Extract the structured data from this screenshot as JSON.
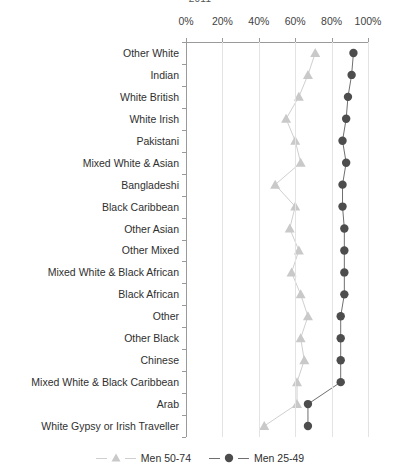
{
  "chart_data": {
    "type": "scatter",
    "title": "2011",
    "xlabel": "",
    "ylabel": "",
    "xlim": [
      0,
      100
    ],
    "xticks": [
      "0%",
      "20%",
      "40%",
      "60%",
      "80%",
      "100%"
    ],
    "xtick_values": [
      0,
      20,
      40,
      60,
      80,
      100
    ],
    "grid": "vertical",
    "axis_position": "top",
    "legend_position": "bottom-center",
    "categories": [
      "Other White",
      "Indian",
      "White British",
      "White Irish",
      "Pakistani",
      "Mixed White & Asian",
      "Bangladeshi",
      "Black Caribbean",
      "Other Asian",
      "Other Mixed",
      "Mixed White & Black African",
      "Black African",
      "Other",
      "Other Black",
      "Chinese",
      "Mixed White & Black Caribbean",
      "Arab",
      "White Gypsy or Irish Traveller"
    ],
    "series": [
      {
        "name": "Men 50-74",
        "marker": "triangle",
        "color": "#c9c9c9",
        "line_color": "#cfcfcf",
        "values": [
          71,
          67,
          62,
          55,
          60,
          63,
          49,
          60,
          57,
          62,
          58,
          63,
          67,
          63,
          65,
          61,
          61,
          43
        ]
      },
      {
        "name": "Men 25-49",
        "marker": "circle",
        "color": "#4d4d4d",
        "line_color": "#6f6f6f",
        "values": [
          92,
          91,
          89,
          88,
          86,
          88,
          86,
          86,
          87,
          87,
          87,
          87,
          85,
          85,
          85,
          85,
          67,
          67
        ]
      }
    ]
  },
  "colors": {
    "axis": "#9a9a9a",
    "gridline": "#e3e3e3",
    "text": "#2f2f2f",
    "series_50_74": "#c9c9c9",
    "series_25_49": "#4d4d4d",
    "background": "#ffffff"
  }
}
